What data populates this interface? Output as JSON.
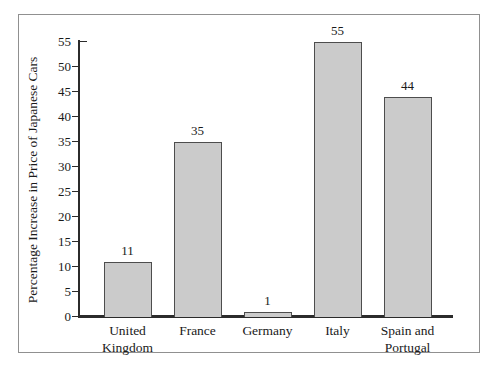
{
  "chart_data": {
    "type": "bar",
    "title": "",
    "xlabel": "",
    "ylabel": "Percentage Increase in Price of Japanese Cars",
    "categories": [
      "United\nKingdom",
      "France",
      "Germany",
      "Italy",
      "Spain and\nPortugal"
    ],
    "values": [
      11,
      35,
      1,
      55,
      44
    ],
    "data_labels": [
      "11",
      "35",
      "1",
      "55",
      "44"
    ],
    "ylim": [
      0,
      55
    ],
    "yticks": [
      0,
      5,
      10,
      15,
      20,
      25,
      30,
      35,
      40,
      45,
      50,
      55
    ],
    "grid": false,
    "legend": "none",
    "colors": {
      "bar_fill": "#cbcbcb",
      "bar_border": "#4d4d4d",
      "axis": "#2b2b2b",
      "frame_border": "#909090",
      "text": "#1a1a1a",
      "background": "#ffffff"
    }
  }
}
